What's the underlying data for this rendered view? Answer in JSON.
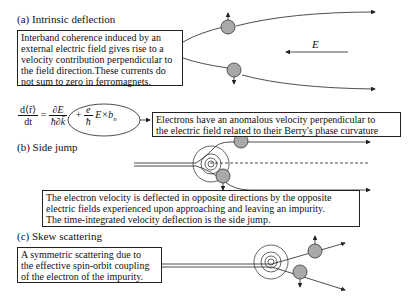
{
  "sections": {
    "a": {
      "label": "(a)",
      "title": "Intrinsic deflection",
      "description_lines": [
        "Interband coherence induced by an",
        "external electric field gives rise to a",
        "velocity contribution perpendicular to",
        "the field direction.These currents do",
        "not sum to zero in ferromagnets."
      ],
      "field_label": "E",
      "equation": {
        "lhs_num": "d⟨r̄⟩",
        "lhs_den": "dt",
        "equals": "=",
        "term1_num": "∂E",
        "term1_den": "ħ∂k̄",
        "plus": "+",
        "term2_num": "e",
        "term2_den": "ħ",
        "term2_rest": "E×b",
        "term2_sub": "n"
      },
      "note_lines": [
        "Electrons have an anomalous velocity perpendicular to",
        "the electric field related to their Berry's phase curvature"
      ]
    },
    "b": {
      "label": "(b)",
      "title": "Side jump",
      "description_lines": [
        "The electron velocity is deflected in opposite directions by the opposite",
        "electric fields experienced upon approaching and leaving an impurity.",
        "The time-integrated velocity deflection is the side jump."
      ]
    },
    "c": {
      "label": "(c)",
      "title": "Skew scattering",
      "description_lines": [
        "A symmetric scattering due to",
        "the effective spin-orbit coupling",
        "of the electron of the impurity."
      ]
    }
  },
  "colors": {
    "electron_fill": "#a9a9a9",
    "line": "#222222",
    "text": "#111111"
  }
}
